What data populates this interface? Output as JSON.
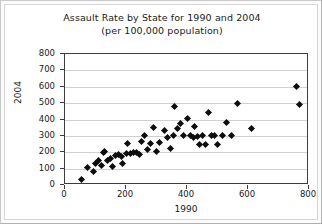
{
  "chart_data": {
    "type": "scatter",
    "title": "Assault Rate by State for 1990 and 2004",
    "subtitle": "(per 100,000 population)",
    "xlabel": "1990",
    "ylabel": "2004",
    "xlim": [
      0,
      800
    ],
    "ylim": [
      0,
      800
    ],
    "xticks": [
      0,
      200,
      400,
      600,
      800
    ],
    "yticks": [
      0,
      100,
      200,
      300,
      400,
      500,
      600,
      700,
      800
    ],
    "grid": true,
    "legend": false,
    "marker": "diamond",
    "marker_color": "#0d0d0d",
    "points": [
      [
        55,
        35
      ],
      [
        75,
        105
      ],
      [
        95,
        80
      ],
      [
        100,
        130
      ],
      [
        110,
        150
      ],
      [
        120,
        120
      ],
      [
        125,
        200
      ],
      [
        130,
        205
      ],
      [
        140,
        150
      ],
      [
        150,
        160
      ],
      [
        155,
        115
      ],
      [
        165,
        180
      ],
      [
        175,
        185
      ],
      [
        185,
        175
      ],
      [
        190,
        130
      ],
      [
        200,
        195
      ],
      [
        205,
        255
      ],
      [
        215,
        190
      ],
      [
        225,
        200
      ],
      [
        235,
        200
      ],
      [
        245,
        185
      ],
      [
        250,
        265
      ],
      [
        260,
        300
      ],
      [
        270,
        215
      ],
      [
        280,
        255
      ],
      [
        290,
        350
      ],
      [
        300,
        205
      ],
      [
        310,
        260
      ],
      [
        325,
        330
      ],
      [
        335,
        290
      ],
      [
        345,
        220
      ],
      [
        355,
        305
      ],
      [
        360,
        480
      ],
      [
        370,
        345
      ],
      [
        380,
        375
      ],
      [
        390,
        300
      ],
      [
        400,
        405
      ],
      [
        410,
        300
      ],
      [
        420,
        290
      ],
      [
        425,
        355
      ],
      [
        435,
        295
      ],
      [
        440,
        245
      ],
      [
        450,
        300
      ],
      [
        460,
        250
      ],
      [
        470,
        440
      ],
      [
        480,
        300
      ],
      [
        490,
        305
      ],
      [
        500,
        250
      ],
      [
        515,
        300
      ],
      [
        530,
        380
      ],
      [
        545,
        300
      ],
      [
        565,
        500
      ],
      [
        610,
        345
      ],
      [
        760,
        600
      ],
      [
        770,
        490
      ]
    ]
  }
}
